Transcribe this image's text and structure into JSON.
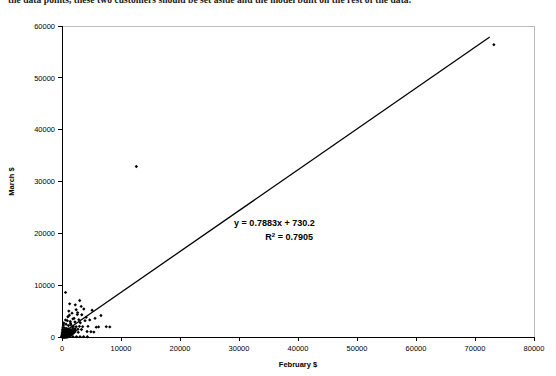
{
  "document": {
    "top_text_fragment": "the data points, these two customers should be set aside and the model built on the rest of the data."
  },
  "chart_data": {
    "type": "scatter",
    "title": "",
    "xlabel": "February $",
    "ylabel": "March $",
    "xlim": [
      0,
      80000
    ],
    "ylim": [
      0,
      60000
    ],
    "xticks": [
      0,
      10000,
      20000,
      30000,
      40000,
      50000,
      60000,
      70000,
      80000
    ],
    "yticks": [
      0,
      10000,
      20000,
      30000,
      40000,
      50000,
      60000
    ],
    "xtick_labels": [
      "0",
      "10000",
      "20000",
      "30000",
      "40000",
      "50000",
      "60000",
      "70000",
      "80000"
    ],
    "ytick_labels": [
      "0",
      "10000",
      "20000",
      "30000",
      "40000",
      "50000",
      "60000"
    ],
    "grid": false,
    "legend": null,
    "marker": "diamond",
    "marker_color": "#000000",
    "annotations": [
      {
        "name": "regression-equation",
        "text": "y = 0.7883x + 730.2",
        "x": 36000,
        "y": 21500
      },
      {
        "name": "r-squared",
        "text": "R",
        "sup": "2",
        "text_after": " = 0.7905",
        "x": 38500,
        "y": 18800
      }
    ],
    "trendline": {
      "type": "linear",
      "slope": 0.7883,
      "intercept": 730.2,
      "r_squared": 0.7905,
      "equation_label": "y = 0.7883x + 730.2",
      "r2_label": "R2 = 0.7905",
      "x_start": 0,
      "x_end": 72500
    },
    "points": [
      [
        73200,
        56400
      ],
      [
        12600,
        32900
      ],
      [
        600,
        8600
      ],
      [
        1300,
        6400
      ],
      [
        2250,
        6200
      ],
      [
        3000,
        7050
      ],
      [
        2400,
        5250
      ],
      [
        3700,
        5400
      ],
      [
        1150,
        5000
      ],
      [
        1700,
        4600
      ],
      [
        2600,
        4350
      ],
      [
        3350,
        4300
      ],
      [
        5100,
        5150
      ],
      [
        4100,
        3800
      ],
      [
        1000,
        3900
      ],
      [
        1850,
        3500
      ],
      [
        2850,
        3350
      ],
      [
        600,
        3300
      ],
      [
        1400,
        3000
      ],
      [
        2200,
        2900
      ],
      [
        3100,
        2750
      ],
      [
        3900,
        3150
      ],
      [
        4700,
        3300
      ],
      [
        5600,
        3600
      ],
      [
        6600,
        4150
      ],
      [
        7500,
        2000
      ],
      [
        8100,
        1950
      ],
      [
        6200,
        1950
      ],
      [
        5800,
        1900
      ],
      [
        4900,
        1000
      ],
      [
        4400,
        2050
      ],
      [
        3500,
        2000
      ],
      [
        2950,
        2050
      ],
      [
        2400,
        2000
      ],
      [
        1900,
        2050
      ],
      [
        300,
        2700
      ],
      [
        250,
        2300
      ],
      [
        700,
        2450
      ],
      [
        1100,
        2200
      ],
      [
        1500,
        2350
      ],
      [
        1800,
        1750
      ],
      [
        2200,
        1600
      ],
      [
        2700,
        1500
      ],
      [
        3300,
        1450
      ],
      [
        150,
        1900
      ],
      [
        450,
        1750
      ],
      [
        800,
        1650
      ],
      [
        1150,
        1550
      ],
      [
        1500,
        1400
      ],
      [
        1900,
        1300
      ],
      [
        2300,
        1250
      ],
      [
        100,
        1500
      ],
      [
        350,
        1400
      ],
      [
        620,
        1350
      ],
      [
        900,
        1300
      ],
      [
        1200,
        1200
      ],
      [
        1550,
        1150
      ],
      [
        1850,
        1100
      ],
      [
        2150,
        1050
      ],
      [
        80,
        1150
      ],
      [
        300,
        1100
      ],
      [
        520,
        1050
      ],
      [
        760,
        1000
      ],
      [
        1000,
        980
      ],
      [
        1280,
        950
      ],
      [
        1520,
        900
      ],
      [
        1800,
        880
      ],
      [
        2050,
        850
      ],
      [
        60,
        850
      ],
      [
        240,
        820
      ],
      [
        420,
        800
      ],
      [
        600,
        780
      ],
      [
        800,
        760
      ],
      [
        980,
        740
      ],
      [
        1180,
        720
      ],
      [
        1380,
        700
      ],
      [
        1600,
        680
      ],
      [
        1850,
        660
      ],
      [
        40,
        600
      ],
      [
        180,
        590
      ],
      [
        330,
        580
      ],
      [
        480,
        570
      ],
      [
        640,
        560
      ],
      [
        800,
        550
      ],
      [
        960,
        540
      ],
      [
        1120,
        530
      ],
      [
        1300,
        520
      ],
      [
        1480,
        510
      ],
      [
        1660,
        500
      ],
      [
        30,
        420
      ],
      [
        150,
        410
      ],
      [
        280,
        400
      ],
      [
        400,
        395
      ],
      [
        530,
        390
      ],
      [
        660,
        385
      ],
      [
        790,
        380
      ],
      [
        920,
        370
      ],
      [
        1060,
        360
      ],
      [
        1200,
        350
      ],
      [
        1350,
        345
      ],
      [
        1500,
        340
      ],
      [
        20,
        280
      ],
      [
        120,
        275
      ],
      [
        230,
        270
      ],
      [
        340,
        265
      ],
      [
        450,
        260
      ],
      [
        560,
        255
      ],
      [
        680,
        250
      ],
      [
        800,
        245
      ],
      [
        920,
        240
      ],
      [
        1050,
        235
      ],
      [
        1180,
        230
      ],
      [
        1320,
        225
      ],
      [
        15,
        180
      ],
      [
        100,
        175
      ],
      [
        190,
        172
      ],
      [
        280,
        168
      ],
      [
        380,
        165
      ],
      [
        470,
        160
      ],
      [
        570,
        155
      ],
      [
        670,
        150
      ],
      [
        780,
        148
      ],
      [
        880,
        145
      ],
      [
        990,
        140
      ],
      [
        1100,
        138
      ],
      [
        1220,
        135
      ],
      [
        10,
        110
      ],
      [
        80,
        108
      ],
      [
        160,
        105
      ],
      [
        240,
        102
      ],
      [
        320,
        100
      ],
      [
        400,
        98
      ],
      [
        490,
        95
      ],
      [
        580,
        92
      ],
      [
        670,
        90
      ],
      [
        760,
        88
      ],
      [
        860,
        85
      ],
      [
        960,
        82
      ],
      [
        1060,
        80
      ],
      [
        1160,
        78
      ],
      [
        8,
        60
      ],
      [
        60,
        58
      ],
      [
        120,
        56
      ],
      [
        185,
        54
      ],
      [
        250,
        52
      ],
      [
        320,
        50
      ],
      [
        390,
        48
      ],
      [
        460,
        46
      ],
      [
        540,
        44
      ],
      [
        620,
        42
      ],
      [
        700,
        40
      ],
      [
        790,
        38
      ],
      [
        880,
        36
      ],
      [
        970,
        34
      ],
      [
        5,
        25
      ],
      [
        50,
        24
      ],
      [
        100,
        23
      ],
      [
        155,
        22
      ],
      [
        210,
        21
      ],
      [
        270,
        20
      ],
      [
        330,
        19
      ],
      [
        400,
        18
      ],
      [
        470,
        17
      ],
      [
        545,
        16
      ],
      [
        620,
        15
      ],
      [
        700,
        14
      ],
      [
        1450,
        2650
      ],
      [
        2050,
        3600
      ],
      [
        2650,
        4700
      ],
      [
        1250,
        4200
      ],
      [
        900,
        3150
      ],
      [
        3250,
        5900
      ],
      [
        2100,
        950
      ],
      [
        2750,
        900
      ],
      [
        1600,
        960
      ],
      [
        4250,
        1050
      ],
      [
        5400,
        950
      ],
      [
        1150,
        80
      ],
      [
        1850,
        75
      ],
      [
        2450,
        70
      ],
      [
        3050,
        68
      ],
      [
        3650,
        65
      ],
      [
        4300,
        60
      ]
    ]
  }
}
